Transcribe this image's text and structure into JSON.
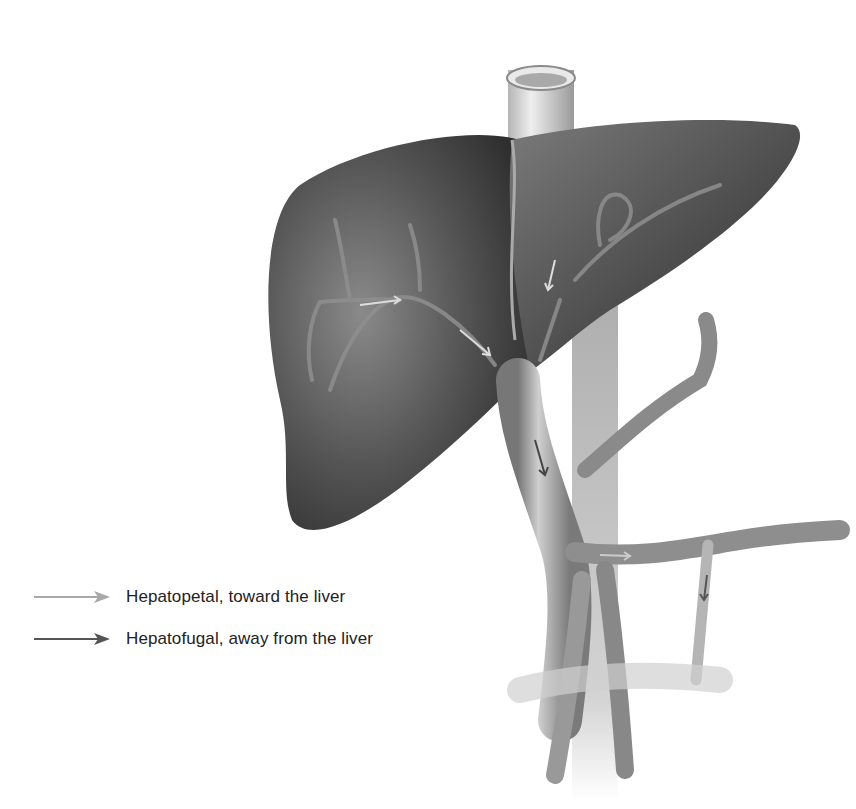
{
  "figure": {
    "colors": {
      "background": "#ffffff",
      "liver_dark": "#3a3a3a",
      "liver_mid": "#6b6b6b",
      "vessel_light": "#bdbdbd",
      "vessel_mid": "#8a8a8a"
    }
  },
  "legend": {
    "items": [
      {
        "label": "Hepatopetal, toward the liver",
        "arrow_color": "#a8a8a8"
      },
      {
        "label": "Hepatofugal, away from the liver",
        "arrow_color": "#555555"
      }
    ]
  }
}
